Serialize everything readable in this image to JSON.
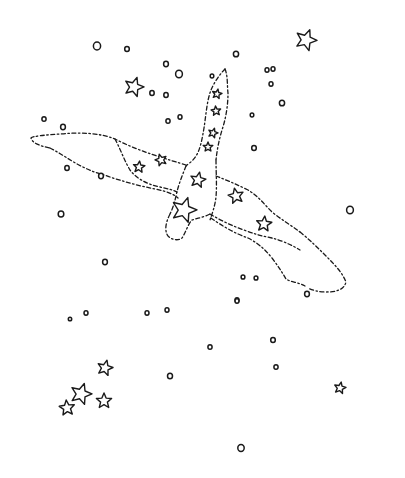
{
  "illustration": {
    "subject": "swan constellation",
    "ink_color": "#1a1a1a",
    "background_color": "#ffffff",
    "outline_style": "dashed",
    "constellation_star_count": 11,
    "background_star_count": 8,
    "background_dot_count": 37
  }
}
